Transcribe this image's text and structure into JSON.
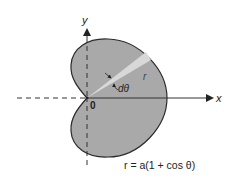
{
  "diagram": {
    "type": "polar-curve",
    "curve": "cardioid",
    "equation": "r = a(1 + cos θ)",
    "labels": {
      "x_axis": "x",
      "y_axis": "y",
      "origin": "0",
      "radius": "r",
      "angle_increment": "dθ"
    },
    "colors": {
      "fill": "#a9a9a9",
      "wedge": "#d6d6d6",
      "stroke": "#2a2a2a",
      "axis": "#333333"
    }
  }
}
